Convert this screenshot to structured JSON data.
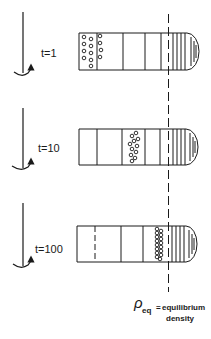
{
  "diagram": {
    "colors": {
      "ink": "#1a1a1a",
      "background": "#ffffff"
    },
    "panels": [
      {
        "label": "t=1",
        "arrow": "rotation-arrow-icon",
        "particles": "dispersed at top of tube"
      },
      {
        "label": "t=10",
        "arrow": "rotation-arrow-icon",
        "particles": "band moving down tube"
      },
      {
        "label": "t=100",
        "arrow": "rotation-arrow-icon",
        "particles": "band at equilibrium density"
      }
    ],
    "equilibrium_line": {
      "symbol": "ρ",
      "subscript": "eq",
      "equals": "=",
      "text_line1": "equilibrium",
      "text_line2": "density"
    }
  }
}
